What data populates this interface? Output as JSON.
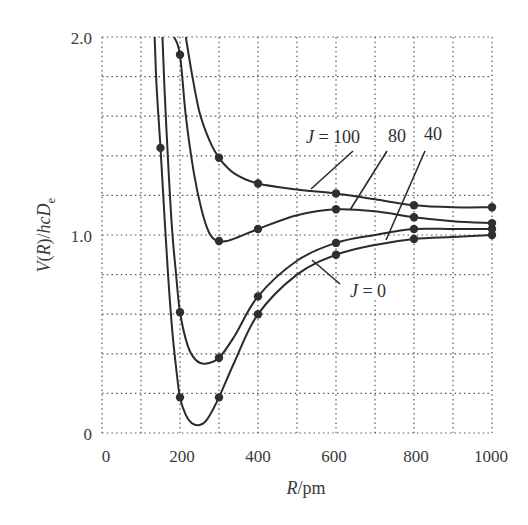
{
  "chart_data": {
    "type": "line",
    "title": "",
    "xlabel": "R/pm",
    "ylabel": "V(R)/hcDe",
    "xlim": [
      0,
      1000
    ],
    "ylim": [
      0,
      2.0
    ],
    "x_ticks": [
      0,
      200,
      400,
      600,
      800,
      1000
    ],
    "x_tick_labels": [
      "0",
      "200",
      "400",
      "600",
      "800",
      "1000"
    ],
    "y_ticks": [
      0,
      1.0,
      2.0
    ],
    "y_tick_labels": [
      "0",
      "1.0",
      "2.0"
    ],
    "grid": {
      "on": true,
      "style": "dotted",
      "x_step": 100,
      "y_step": 0.2
    },
    "series": [
      {
        "name": "J = 0",
        "curve": [
          [
            135,
            2.0
          ],
          [
            140,
            1.75
          ],
          [
            150,
            1.44
          ],
          [
            160,
            1.1
          ],
          [
            170,
            0.78
          ],
          [
            180,
            0.52
          ],
          [
            190,
            0.33
          ],
          [
            200,
            0.18
          ],
          [
            215,
            0.09
          ],
          [
            230,
            0.05
          ],
          [
            250,
            0.04
          ],
          [
            270,
            0.07
          ],
          [
            300,
            0.18
          ],
          [
            340,
            0.36
          ],
          [
            400,
            0.6
          ],
          [
            500,
            0.8
          ],
          [
            600,
            0.9
          ],
          [
            700,
            0.95
          ],
          [
            800,
            0.98
          ],
          [
            900,
            0.99
          ],
          [
            1000,
            1.0
          ]
        ],
        "points": [
          [
            150,
            1.44
          ],
          [
            200,
            0.18
          ],
          [
            300,
            0.18
          ],
          [
            400,
            0.6
          ],
          [
            600,
            0.9
          ],
          [
            800,
            0.98
          ],
          [
            1000,
            1.0
          ]
        ]
      },
      {
        "name": "J = 40",
        "curve": [
          [
            155,
            2.0
          ],
          [
            160,
            1.75
          ],
          [
            170,
            1.35
          ],
          [
            180,
            1.02
          ],
          [
            190,
            0.8
          ],
          [
            200,
            0.61
          ],
          [
            220,
            0.44
          ],
          [
            240,
            0.37
          ],
          [
            265,
            0.35
          ],
          [
            300,
            0.38
          ],
          [
            340,
            0.49
          ],
          [
            400,
            0.69
          ],
          [
            500,
            0.87
          ],
          [
            600,
            0.96
          ],
          [
            700,
            1.0
          ],
          [
            800,
            1.03
          ],
          [
            900,
            1.03
          ],
          [
            1000,
            1.03
          ]
        ],
        "points": [
          [
            200,
            0.61
          ],
          [
            300,
            0.38
          ],
          [
            400,
            0.69
          ],
          [
            600,
            0.96
          ],
          [
            800,
            1.03
          ],
          [
            1000,
            1.03
          ]
        ]
      },
      {
        "name": "J = 80",
        "curve": [
          [
            185,
            2.0
          ],
          [
            200,
            1.91
          ],
          [
            215,
            1.6
          ],
          [
            235,
            1.32
          ],
          [
            255,
            1.13
          ],
          [
            275,
            1.01
          ],
          [
            295,
            0.97
          ],
          [
            320,
            0.97
          ],
          [
            350,
            0.99
          ],
          [
            400,
            1.03
          ],
          [
            500,
            1.1
          ],
          [
            600,
            1.13
          ],
          [
            700,
            1.12
          ],
          [
            800,
            1.09
          ],
          [
            900,
            1.07
          ],
          [
            1000,
            1.06
          ]
        ],
        "points": [
          [
            200,
            1.91
          ],
          [
            300,
            0.97
          ],
          [
            400,
            1.03
          ],
          [
            600,
            1.13
          ],
          [
            800,
            1.09
          ],
          [
            1000,
            1.06
          ]
        ]
      },
      {
        "name": "J = 100",
        "curve": [
          [
            215,
            2.0
          ],
          [
            230,
            1.82
          ],
          [
            250,
            1.62
          ],
          [
            275,
            1.48
          ],
          [
            300,
            1.39
          ],
          [
            340,
            1.31
          ],
          [
            400,
            1.26
          ],
          [
            500,
            1.23
          ],
          [
            600,
            1.21
          ],
          [
            700,
            1.18
          ],
          [
            800,
            1.15
          ],
          [
            900,
            1.14
          ],
          [
            1000,
            1.14
          ]
        ],
        "points": [
          [
            300,
            1.39
          ],
          [
            400,
            1.26
          ],
          [
            600,
            1.21
          ],
          [
            800,
            1.15
          ],
          [
            1000,
            1.14
          ]
        ]
      }
    ],
    "annotations": [
      {
        "text": "J = 100",
        "italic_part": "J",
        "label_at": [
          333,
          137
        ],
        "leader": [
          [
            353,
            151
          ],
          [
            311,
            189
          ]
        ]
      },
      {
        "text": "80",
        "label_at": [
          397,
          137
        ],
        "leader": [
          [
            387,
            151
          ],
          [
            350,
            210
          ]
        ]
      },
      {
        "text": "40",
        "label_at": [
          433,
          135
        ],
        "leader": [
          [
            425,
            151
          ],
          [
            386,
            240
          ]
        ]
      },
      {
        "text": "J = 0",
        "italic_part": "J",
        "label_at": [
          367,
          290
        ],
        "leader": [
          [
            340,
            285
          ],
          [
            312,
            260
          ]
        ]
      }
    ]
  },
  "labels": {
    "xlabel_italic": "R",
    "xlabel_rest": "/pm",
    "ylabel_parts": [
      "V",
      "(",
      "R",
      ")/",
      "hcD",
      "e"
    ],
    "ann_j100_j": "J",
    "ann_j100_rest": " = 100",
    "ann_80": "80",
    "ann_40": "40",
    "ann_j0_j": "J",
    "ann_j0_rest": " = 0",
    "ytick_0": "0",
    "ytick_1": "1.0",
    "ytick_2": "2.0",
    "xtick_0": "0",
    "xtick_200": "200",
    "xtick_400": "400",
    "xtick_600": "600",
    "xtick_800": "800",
    "xtick_1000": "1000"
  }
}
